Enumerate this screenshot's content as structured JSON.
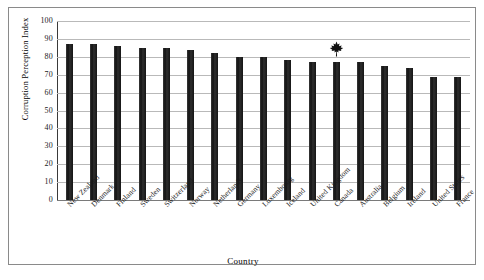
{
  "chart_data": {
    "type": "bar",
    "title": "",
    "xlabel": "Country",
    "ylabel": "Corruption Perception Index",
    "ylim": [
      0,
      100
    ],
    "ytick_step": 10,
    "yticks": [
      100,
      90,
      80,
      70,
      60,
      50,
      40,
      30,
      20,
      10,
      0
    ],
    "grid": true,
    "legend": "none",
    "bar_color": "#1c1c1c",
    "gridline_color": "#b9b9b9",
    "categories": [
      "New Zealand",
      "Denmark",
      "Finland",
      "Sweden",
      "Switzerland",
      "Norway",
      "Netherlands",
      "Germany",
      "Luxembourg",
      "Iceland",
      "United Kingdom",
      "Canada",
      "Australia",
      "Belgium",
      "Ireland",
      "United States",
      "France"
    ],
    "values": [
      87,
      87,
      86,
      85,
      85,
      84,
      82,
      80,
      80,
      78,
      77,
      77,
      77,
      75,
      74,
      69,
      69
    ],
    "annotations": [
      {
        "icon": "maple-leaf-icon",
        "category": "Canada",
        "value": 77,
        "description": "Black maple leaf marker placed above the Canada bar"
      }
    ]
  }
}
